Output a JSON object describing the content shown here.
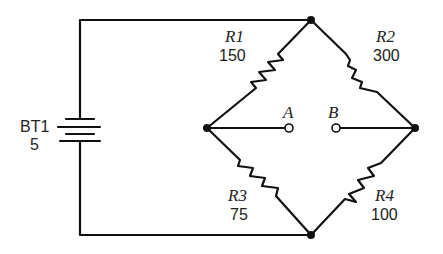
{
  "diagram": {
    "type": "Wheatstone bridge circuit",
    "battery": {
      "name": "BT1",
      "value": "5"
    },
    "resistors": [
      {
        "name": "R1",
        "value": "150"
      },
      {
        "name": "R2",
        "value": "300"
      },
      {
        "name": "R3",
        "value": "75"
      },
      {
        "name": "R4",
        "value": "100"
      }
    ],
    "terminals": [
      {
        "name": "A"
      },
      {
        "name": "B"
      }
    ],
    "colors": {
      "line": "#111111",
      "background": "#ffffff"
    }
  }
}
